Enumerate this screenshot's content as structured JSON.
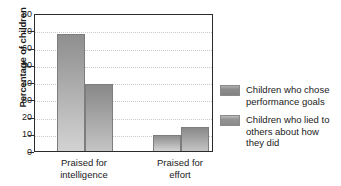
{
  "chart_data": {
    "type": "bar",
    "title": "",
    "xlabel": "",
    "ylabel": "Percentage of children",
    "ylim": [
      0,
      80
    ],
    "ytick_values": [
      0,
      10,
      20,
      30,
      40,
      50,
      60,
      70,
      80
    ],
    "ytick_labels": [
      "0",
      "10",
      "20",
      "30",
      "40",
      "50",
      "60",
      "70",
      "80"
    ],
    "grid": true,
    "legend_position": "right",
    "categories": [
      "Praised for\nintelligence",
      "Praised for\neffort"
    ],
    "series": [
      {
        "name": "Children who chose\nperformance goals",
        "values": [
          68,
          9
        ],
        "color": "#a5a5a5"
      },
      {
        "name": "Children who lied to\nothers about how\nthey did",
        "values": [
          39,
          14
        ],
        "color": "#9e9e9e"
      }
    ]
  },
  "axis": {
    "y_title": "Percentage of children"
  },
  "legend": {
    "items": [
      {
        "label": "Children who chose\nperformance goals"
      },
      {
        "label": "Children who lied to\nothers about how\nthey did"
      }
    ]
  },
  "colors": {
    "frame": "#2b2b2b",
    "gridline": "#c9c9c9",
    "bar_border": "#7d7d7d",
    "text": "#1a1a1a"
  }
}
